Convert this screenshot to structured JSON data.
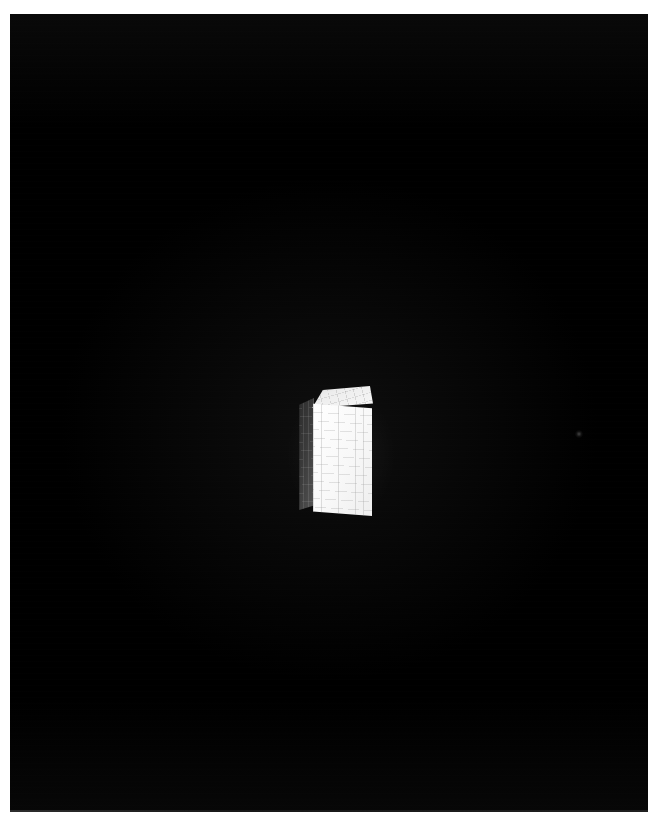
{
  "scene": {
    "title": "3D rendered rectangular box on black background",
    "background_color": "#000000",
    "page_margin_color": "#ffffff",
    "canvas": {
      "x": 10,
      "y": 14,
      "width": 638,
      "height": 798
    }
  },
  "object": {
    "name": "box",
    "shape": "rectangular prism",
    "description": "White gridded box rendered in three-quarter perspective",
    "faces": [
      {
        "id": "front",
        "label": "front-face",
        "color": "#f5f5f5",
        "shading": "lit",
        "grid_columns": 7,
        "grid_rows": 13,
        "grid_line_color": "#969696"
      },
      {
        "id": "left",
        "label": "left-face",
        "color": "#3a3a3a",
        "shading": "shadowed",
        "grid_columns": 3,
        "grid_rows": 13,
        "grid_line_color": "#c8c8c8"
      },
      {
        "id": "top",
        "label": "top-face",
        "color": "#e6e6e6",
        "shading": "highlight",
        "grid_columns": 7,
        "grid_rows": 3,
        "grid_line_color": "#828282"
      }
    ],
    "bounds": {
      "x": 288,
      "y": 371,
      "width": 75,
      "height": 132
    }
  },
  "artifacts": {
    "speck_label": "faint-speck",
    "speck_position": {
      "x": 569,
      "y": 420
    },
    "glow_label": "object-bloom"
  }
}
